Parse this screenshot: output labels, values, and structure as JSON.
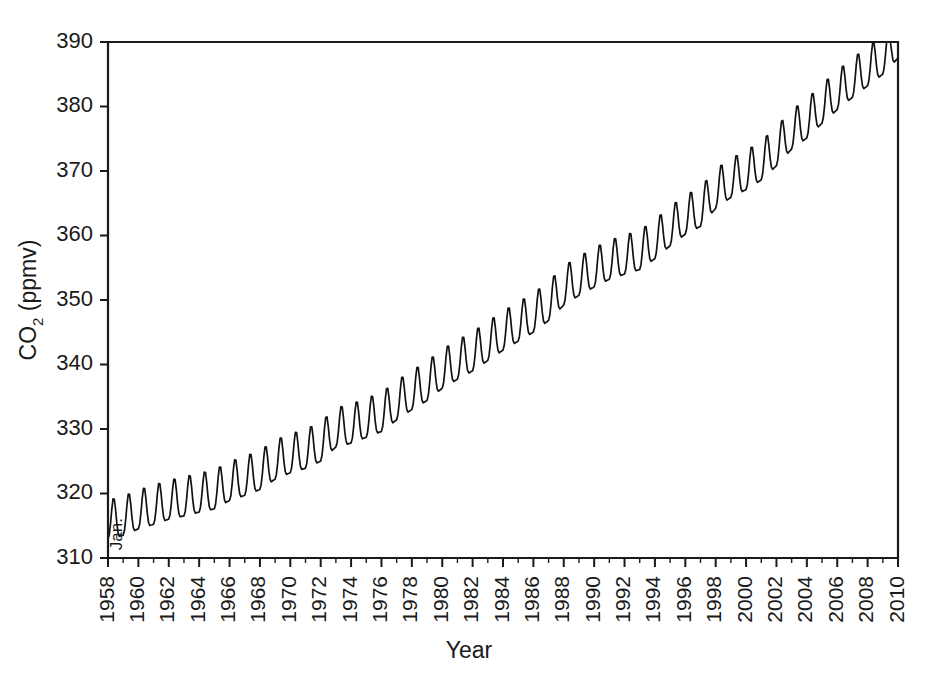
{
  "figure": {
    "background": "#ffffff",
    "line_color": "#111111",
    "axis_color": "#1a1a1a"
  },
  "annotations": [
    {
      "name": "jan-marker",
      "text": "Jan.",
      "year": 1958.6,
      "value": 316.2
    }
  ],
  "chart_data": {
    "type": "line",
    "title": "",
    "xlabel": "Year",
    "ylabel": "CO2 (ppmv)",
    "ylabel_parts": {
      "pre": "CO",
      "sub": "2",
      "post": " (ppmv)"
    },
    "xlim": [
      1958,
      2010
    ],
    "ylim": [
      310,
      390
    ],
    "grid": false,
    "legend": null,
    "xticks": [
      1958,
      1960,
      1962,
      1964,
      1966,
      1968,
      1970,
      1972,
      1974,
      1976,
      1978,
      1980,
      1982,
      1984,
      1986,
      1988,
      1990,
      1992,
      1994,
      1996,
      1998,
      2000,
      2002,
      2004,
      2006,
      2008,
      2010
    ],
    "xticklabels": [
      "1958",
      "1960",
      "1962",
      "1964",
      "1966",
      "1968",
      "1970",
      "1972",
      "1974",
      "1976",
      "1978",
      "1980",
      "1982",
      "1984",
      "1986",
      "1988",
      "1990",
      "1992",
      "1994",
      "1996",
      "1998",
      "2000",
      "2002",
      "2004",
      "2006",
      "2008",
      "2010"
    ],
    "xtick_minor": [
      1959,
      1961,
      1963,
      1965,
      1967,
      1969,
      1971,
      1973,
      1975,
      1977,
      1979,
      1981,
      1983,
      1985,
      1987,
      1989,
      1991,
      1993,
      1995,
      1997,
      1999,
      2001,
      2003,
      2005,
      2007,
      2009
    ],
    "xtick_rotation": 90,
    "yticks": [
      310,
      320,
      330,
      340,
      350,
      360,
      370,
      380,
      390
    ],
    "yticklabels": [
      "310",
      "320",
      "330",
      "340",
      "350",
      "360",
      "370",
      "380",
      "390"
    ],
    "series": [
      {
        "name": "Mauna Loa monthly mean CO2",
        "description": "Monthly atmospheric CO2 concentration with annual sawtooth cycle superimposed on rising trend",
        "seasonal_amplitude_ppmv": 3.1,
        "annual_mean_x": [
          1958,
          1959,
          1960,
          1961,
          1962,
          1963,
          1964,
          1965,
          1966,
          1967,
          1968,
          1969,
          1970,
          1971,
          1972,
          1973,
          1974,
          1975,
          1976,
          1977,
          1978,
          1979,
          1980,
          1981,
          1982,
          1983,
          1984,
          1985,
          1986,
          1987,
          1988,
          1989,
          1990,
          1991,
          1992,
          1993,
          1994,
          1995,
          1996,
          1997,
          1998,
          1999,
          2000,
          2001,
          2002,
          2003,
          2004,
          2005,
          2006,
          2007,
          2008,
          2009,
          2010
        ],
        "annual_mean_y": [
          315.3,
          315.9,
          316.9,
          317.6,
          318.4,
          318.9,
          319.5,
          320.0,
          321.3,
          322.1,
          323.0,
          324.6,
          325.6,
          326.3,
          327.4,
          329.6,
          330.2,
          331.1,
          332.0,
          333.8,
          335.4,
          336.8,
          338.7,
          340.1,
          341.4,
          343.0,
          344.6,
          346.0,
          347.4,
          349.2,
          351.6,
          353.1,
          354.4,
          355.6,
          356.4,
          357.1,
          358.8,
          360.8,
          362.6,
          363.8,
          366.6,
          368.3,
          369.5,
          371.0,
          373.2,
          375.8,
          377.5,
          379.8,
          381.9,
          383.8,
          385.6,
          387.4,
          389.9
        ]
      }
    ]
  },
  "axis_geometry": {
    "plot_left": 108,
    "plot_right": 898,
    "plot_top": 42,
    "plot_bottom": 558
  }
}
